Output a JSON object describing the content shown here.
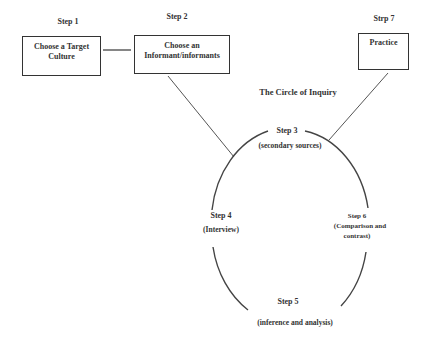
{
  "diagram": {
    "title": "The Circle of Inquiry",
    "steps": [
      {
        "id": 1,
        "heading": "Step 1",
        "text": "Choose a Target Culture",
        "line1": "Choose a Target",
        "line2": "Culture"
      },
      {
        "id": 2,
        "heading": "Step 2",
        "text": "Choose an Informant/informants",
        "line1": "Choose an",
        "line2": "Informant/informants"
      },
      {
        "id": 3,
        "heading": "Step 3",
        "text": "(secondary sources)"
      },
      {
        "id": 4,
        "heading": "Step 4",
        "text": "(Interview)"
      },
      {
        "id": 5,
        "heading": "Step 5",
        "text": "(inference and  analysis)"
      },
      {
        "id": 6,
        "heading": "Step 6",
        "text": "(Comparison and contrast)",
        "line1": "(Comparison and",
        "line2": "contrast)"
      },
      {
        "id": 7,
        "heading": "Strp 7",
        "text": "Practice"
      }
    ],
    "connections": [
      {
        "from": "step-1-box",
        "to": "step-2-box"
      },
      {
        "from": "step-2-box",
        "to": "circle-of-inquiry"
      },
      {
        "from": "step-7-box",
        "to": "circle-of-inquiry"
      }
    ],
    "colors": {
      "stroke": "#333333",
      "text": "#333333",
      "background": "#ffffff"
    }
  }
}
